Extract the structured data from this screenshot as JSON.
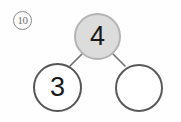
{
  "worksheet": {
    "problem_number": "10",
    "problem_number_style": "circled",
    "type": "number-bond",
    "colors": {
      "total_fill": "#dcdcdc",
      "total_stroke": "#b4b4b4",
      "part_fill": "#ffffff",
      "part_stroke": "#555555",
      "connector_stroke": "#707070",
      "digit_color": "#1a1a1a",
      "marker_stroke": "#8a8a8a",
      "background": "#fefefe"
    },
    "bond": {
      "total": {
        "label": "4",
        "filled": true,
        "blank": false
      },
      "parts": [
        {
          "label": "3",
          "filled": false,
          "blank": false
        },
        {
          "label": "",
          "filled": false,
          "blank": true
        }
      ]
    },
    "connectors": [
      {
        "from": "total",
        "to": "part-left"
      },
      {
        "from": "total",
        "to": "part-right"
      }
    ]
  }
}
